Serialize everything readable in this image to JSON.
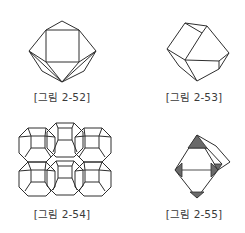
{
  "figures": [
    {
      "id": "fig-2-52",
      "caption": "[그림 2-52]",
      "shape": "cuboctahedron-like polyhedron with square face"
    },
    {
      "id": "fig-2-53",
      "caption": "[그림 2-53]",
      "shape": "rhombic dodecahedron"
    },
    {
      "id": "fig-2-54",
      "caption": "[그림 2-54]",
      "shape": "truncated octahedra packing (sodalite cage framework)"
    },
    {
      "id": "fig-2-55",
      "caption": "[그림 2-55]",
      "shape": "octahedron with truncated shaded corners"
    }
  ],
  "colors": {
    "line": "#2e2e2e",
    "shade": "#6a6a6a",
    "caption": "#3a3a3a",
    "background": "#ffffff"
  }
}
